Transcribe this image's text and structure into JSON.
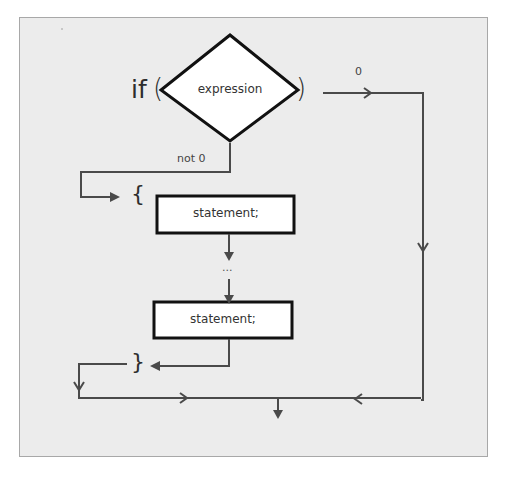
{
  "diagram": {
    "type": "flowchart",
    "title": "",
    "keyword": "if",
    "open_paren": "(",
    "close_paren": ")",
    "condition": "expression",
    "branch_zero_label": "0",
    "branch_nonzero_label": "not 0",
    "open_brace": "{",
    "close_brace": "}",
    "statements": [
      {
        "label": "statement;"
      },
      {
        "label": "statement;"
      }
    ],
    "ellipsis": "...",
    "colors": {
      "background": "#ececec",
      "panel_border": "#a8a8a8",
      "box_fill": "#ffffff",
      "box_stroke": "#111111",
      "connector": "#4a4a4a",
      "text": "#333333"
    }
  }
}
